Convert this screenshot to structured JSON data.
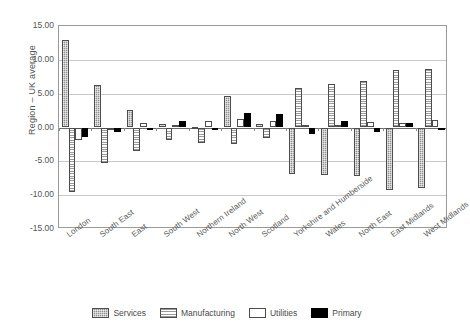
{
  "chart_data": {
    "type": "bar",
    "title": "",
    "xlabel": "",
    "ylabel": "Region – UK average",
    "ylim": [
      -15.0,
      15.0
    ],
    "ytick_labels": [
      "15.00",
      "10.00",
      "5.00",
      "0.00",
      "-5.00",
      "-10.00",
      "-15.00"
    ],
    "ytick_values": [
      15,
      10,
      5,
      0,
      -5,
      -10,
      -15
    ],
    "grid": true,
    "legend_position": "bottom",
    "categories": [
      "London",
      "South East",
      "East",
      "South West",
      "Northern Ireland",
      "North West",
      "Scotland",
      "Yorkshire and Humberside",
      "Wales",
      "North East",
      "East Midlands",
      "West Midlands"
    ],
    "series": [
      {
        "name": "Services",
        "color": "#8e8e8e",
        "pattern": "checker",
        "values": [
          12.9,
          6.3,
          2.6,
          0.5,
          0.1,
          4.7,
          0.5,
          -6.8,
          -7.0,
          -7.2,
          -9.2,
          -9.0
        ]
      },
      {
        "name": "Manufacturing",
        "color": "#9a9a9a",
        "pattern": "horizontal-stripes",
        "values": [
          -9.5,
          -5.2,
          -3.4,
          -1.9,
          -2.3,
          -2.4,
          -1.6,
          5.8,
          6.5,
          6.9,
          8.5,
          8.7
        ]
      },
      {
        "name": "Utilities",
        "color": "#ffffff",
        "pattern": "solid-white",
        "values": [
          -1.8,
          -0.3,
          0.6,
          0.4,
          1.0,
          1.3,
          0.9,
          0.4,
          0.4,
          0.8,
          0.7,
          1.1
        ]
      },
      {
        "name": "Primary",
        "color": "#000000",
        "pattern": "solid-black",
        "values": [
          -1.4,
          -0.6,
          -0.2,
          1.0,
          -0.2,
          2.2,
          2.0,
          -0.9,
          0.9,
          -0.7,
          0.7,
          0.0
        ]
      }
    ]
  },
  "legend": {
    "items": [
      {
        "label": "Services"
      },
      {
        "label": "Manufacturing"
      },
      {
        "label": "Utilities"
      },
      {
        "label": "Primary"
      }
    ]
  }
}
